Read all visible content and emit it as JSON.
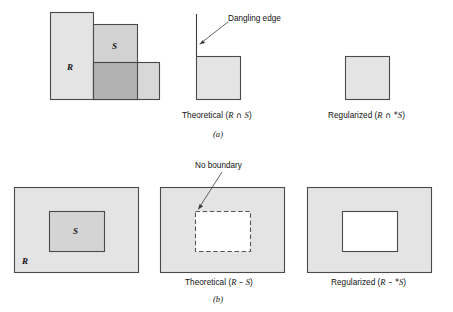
{
  "figure": {
    "title_alt": "Regularized set operations on rectangles R and S",
    "colors": {
      "fill_light": "#e2e2e2",
      "fill_medium": "#d4d4d4",
      "fill_dark": "#b4b4b4",
      "stroke": "#4a4a4a",
      "stroke_thin": "#6b6b6b",
      "white": "#ffffff",
      "text": "#111111",
      "background": "#ffffff"
    },
    "panels": [
      {
        "id": "a",
        "sub_label": "(a)",
        "operation": "intersection",
        "items": [
          {
            "id": "a-operands",
            "kind": "operands",
            "labels": [
              {
                "name": "R",
                "text": "R"
              },
              {
                "name": "S",
                "text": "S"
              }
            ]
          },
          {
            "id": "a-theoretical",
            "kind": "result",
            "caption_prefix": "Theoretical (",
            "caption_left": "R",
            "caption_op": " ∩ ",
            "caption_right": "S",
            "caption_suffix": ")",
            "annotation": "Dangling edge"
          },
          {
            "id": "a-regularized",
            "kind": "result",
            "caption_prefix": "Regularized (",
            "caption_left": "R",
            "caption_op": " ∩ *",
            "caption_right": "S",
            "caption_suffix": ")",
            "annotation": ""
          }
        ]
      },
      {
        "id": "b",
        "sub_label": "(b)",
        "operation": "difference",
        "items": [
          {
            "id": "b-operands",
            "kind": "operands",
            "labels": [
              {
                "name": "R",
                "text": "R"
              },
              {
                "name": "S",
                "text": "S"
              }
            ]
          },
          {
            "id": "b-theoretical",
            "kind": "result",
            "caption_prefix": "Theoretical (",
            "caption_left": "R",
            "caption_op": " – ",
            "caption_right": "S",
            "caption_suffix": ")",
            "annotation": "No boundary"
          },
          {
            "id": "b-regularized",
            "kind": "result",
            "caption_prefix": "Regularized (",
            "caption_left": "R",
            "caption_op": " – *",
            "caption_right": "S",
            "caption_suffix": ")",
            "annotation": ""
          }
        ]
      }
    ],
    "captions": {
      "a_theoretical": {
        "pre": "Theoretical (",
        "r": "R",
        "op": " ∩ ",
        "s": "S",
        "post": ")"
      },
      "a_regularized": {
        "pre": "Regularized (",
        "r": "R",
        "op": " ∩ *",
        "s": "S",
        "post": ")"
      },
      "b_theoretical": {
        "pre": "Theoretical (",
        "r": "R",
        "op": " – ",
        "s": "S",
        "post": ")"
      },
      "b_regularized": {
        "pre": "Regularized (",
        "r": "R",
        "op": " – *",
        "s": "S",
        "post": ")"
      }
    },
    "annotations": {
      "dangling_edge": "Dangling edge",
      "no_boundary": "No boundary"
    },
    "sub_labels": {
      "a": "(a)",
      "b": "(b)"
    },
    "shape_labels": {
      "a_R": "R",
      "a_S": "S",
      "b_R": "R",
      "b_S": "S"
    }
  }
}
